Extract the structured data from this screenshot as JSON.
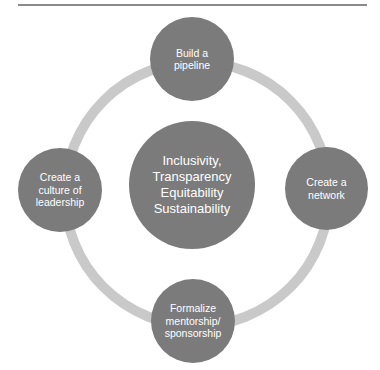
{
  "diagram": {
    "type": "cycle",
    "center": {
      "label": "Inclusivity,\nTransparency\nEquitability\nSustainability",
      "lines": [
        "Inclusivity,",
        "Transparency",
        "Equitability",
        "Sustainability"
      ]
    },
    "nodes": [
      {
        "position": "top",
        "label": "Build a\npipeline"
      },
      {
        "position": "right",
        "label": "Create a\nnetwork"
      },
      {
        "position": "bottom",
        "label": "Formalize\nmentorship/\nsponsorship"
      },
      {
        "position": "left",
        "label": "Create a\nculture of\nleadership"
      }
    ],
    "colors": {
      "node_fill": "#7b7b7b",
      "ring": "#c9c9c9",
      "text": "#ffffff",
      "rule": "#8a8a8a"
    }
  }
}
